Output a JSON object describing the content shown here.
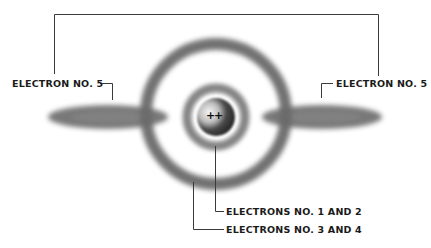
{
  "diagram": {
    "type": "atomic-model",
    "labels": {
      "left_electron": "ELECTRON NO. 5",
      "right_electron": "ELECTRON NO. 5",
      "inner_shell": "ELECTRONS NO. 1 AND 2",
      "outer_shell": "ELECTRONS NO. 3 AND 4"
    },
    "nucleus": {
      "charge_symbol": "+",
      "charge_marks": "+"
    },
    "colors": {
      "line": "#3a3a3a",
      "cloud": "#6e6e6e",
      "nucleus_dark": "#2a2a2a",
      "nucleus_light": "#f4f4f4",
      "text": "#1a1a1a"
    }
  }
}
